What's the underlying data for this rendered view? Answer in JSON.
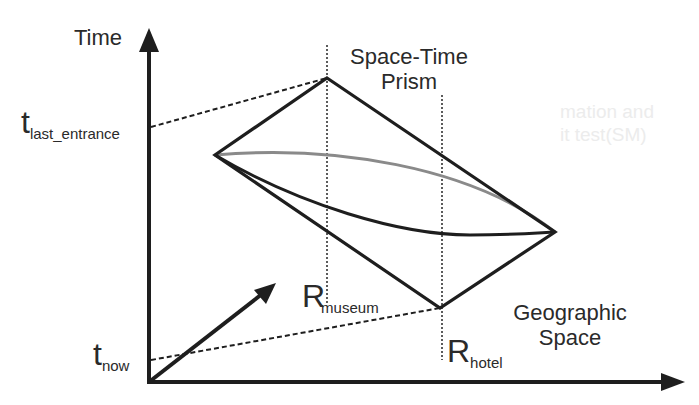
{
  "diagram": {
    "title_line1": "Space-Time",
    "title_line2": "Prism",
    "axes": {
      "y_label": "Time",
      "x_label_line1": "Geographic",
      "x_label_line2": "Space"
    },
    "time_marks": {
      "last_entrance": {
        "base": "t",
        "subscript": "last_entrance"
      },
      "now": {
        "base": "t",
        "subscript": "now"
      }
    },
    "regions": {
      "museum": {
        "base": "R",
        "subscript": "museum"
      },
      "hotel": {
        "base": "R",
        "subscript": "hotel"
      }
    },
    "colors": {
      "line": "#1e1e1e",
      "gray_path": "#8a8a8a",
      "background": "#ffffff"
    },
    "background_bleed": {
      "line1": "mation and",
      "line2": "it test(SM)"
    }
  }
}
